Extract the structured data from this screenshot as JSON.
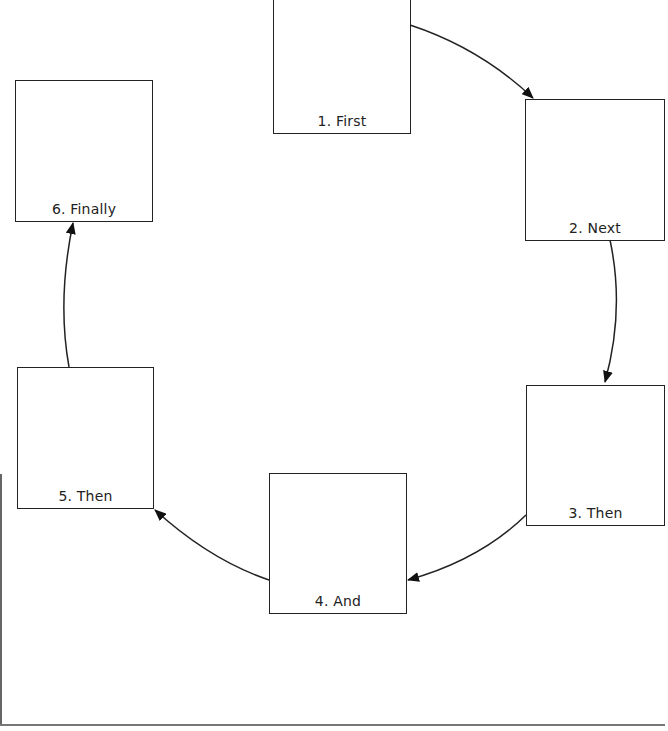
{
  "diagram": {
    "type": "cycle",
    "steps": [
      {
        "id": 1,
        "label": "1. First"
      },
      {
        "id": 2,
        "label": "2. Next"
      },
      {
        "id": 3,
        "label": "3. Then"
      },
      {
        "id": 4,
        "label": "4. And"
      },
      {
        "id": 5,
        "label": "5. Then"
      },
      {
        "id": 6,
        "label": "6. Finally"
      }
    ],
    "connections": [
      {
        "from": 1,
        "to": 2
      },
      {
        "from": 2,
        "to": 3
      },
      {
        "from": 3,
        "to": 4
      },
      {
        "from": 4,
        "to": 5
      },
      {
        "from": 5,
        "to": 6
      }
    ],
    "colors": {
      "stroke": "#222222",
      "background": "#ffffff"
    }
  }
}
